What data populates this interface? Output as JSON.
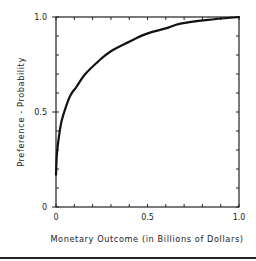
{
  "chart_data": {
    "type": "line",
    "title": "",
    "xlabel": "Monetary Outcome (in Billions of Dollars)",
    "ylabel": "Preference - Probability",
    "xlim": [
      0,
      1.0
    ],
    "ylim": [
      0,
      1.0
    ],
    "grid": false,
    "legend": null,
    "x_ticks": [
      {
        "value": 0,
        "label": "0"
      },
      {
        "value": 0.5,
        "label": "0.5"
      },
      {
        "value": 1.0,
        "label": "1.0"
      }
    ],
    "y_ticks": [
      {
        "value": 0,
        "label": "0"
      },
      {
        "value": 0.5,
        "label": "0.5"
      },
      {
        "value": 1.0,
        "label": "1.0"
      }
    ],
    "minor_tick_interval": 0.1,
    "series": [
      {
        "name": "Utility curve",
        "x": [
          0,
          0.005,
          0.016,
          0.03,
          0.055,
          0.08,
          0.11,
          0.16,
          0.235,
          0.3,
          0.4,
          0.49,
          0.6,
          0.68,
          0.83,
          1.0
        ],
        "y": [
          0.17,
          0.28,
          0.37,
          0.45,
          0.53,
          0.59,
          0.63,
          0.7,
          0.77,
          0.82,
          0.87,
          0.91,
          0.94,
          0.965,
          0.985,
          1.0
        ]
      }
    ]
  },
  "colors": {
    "line": "#111111",
    "axis": "#222222",
    "background": "#ffffff",
    "rule": "#222222"
  },
  "layout": {
    "plot_left": 56,
    "plot_right": 239,
    "plot_top": 17,
    "plot_bottom": 207
  }
}
